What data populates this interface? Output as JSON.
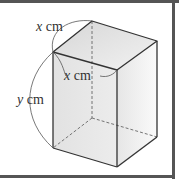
{
  "diagram": {
    "type": "rectangular prism (cuboid) with square base",
    "labels": {
      "top_depth": {
        "variable": "x",
        "unit": "cm"
      },
      "top_width": {
        "variable": "x",
        "unit": "cm"
      },
      "height": {
        "variable": "y",
        "unit": "cm"
      }
    },
    "colors": {
      "edge": "#333333",
      "hidden_edge": "#666666",
      "frame": "#555555",
      "face_front": "#e4e4e4",
      "face_side": "#efefef",
      "face_top": "#dcdcdc"
    }
  }
}
